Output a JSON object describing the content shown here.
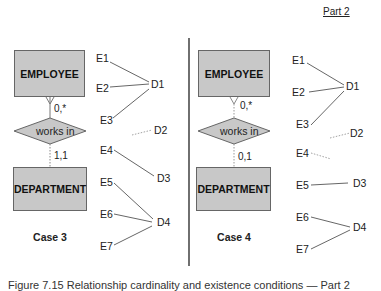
{
  "header": {
    "part_label": "Part 2"
  },
  "cases": [
    {
      "title": "Case 3",
      "entity_top": "EMPLOYEE",
      "relationship": "works in",
      "entity_bottom": "DEPARTMENT",
      "card_top": "0,*",
      "card_bottom": "1,1",
      "employees": [
        "E1",
        "E2",
        "E3",
        "E4",
        "E5",
        "E6",
        "E7"
      ],
      "departments": [
        "D1",
        "D2",
        "D3",
        "D4"
      ],
      "mappings": [
        [
          "E1",
          "D1"
        ],
        [
          "E2",
          "D1"
        ],
        [
          "E3",
          "D1"
        ],
        [
          "E4",
          "D3"
        ],
        [
          "E5",
          "D4"
        ],
        [
          "E6",
          "D4"
        ],
        [
          "E7",
          "D4"
        ]
      ],
      "dangling": [
        "D2"
      ]
    },
    {
      "title": "Case 4",
      "entity_top": "EMPLOYEE",
      "relationship": "works in",
      "entity_bottom": "DEPARTMENT",
      "card_top": "0,*",
      "card_bottom": "0,1",
      "employees": [
        "E1",
        "E2",
        "E3",
        "E4",
        "E5",
        "E6",
        "E7"
      ],
      "departments": [
        "D1",
        "D2",
        "D3",
        "D4"
      ],
      "mappings": [
        [
          "E1",
          "D1"
        ],
        [
          "E2",
          "D1"
        ],
        [
          "E3",
          "D1"
        ],
        [
          "E5",
          "D3"
        ],
        [
          "E6",
          "D4"
        ],
        [
          "E7",
          "D4"
        ]
      ],
      "dangling": [
        "D2",
        "E4"
      ]
    }
  ],
  "caption": "Figure 7.15  Relationship cardinality and existence conditions — Part 2",
  "colors": {
    "entity_fill": "#c8c8c8",
    "line": "#555555",
    "dotted": "#999999"
  }
}
